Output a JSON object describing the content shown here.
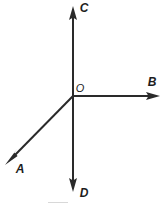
{
  "figure": {
    "type": "ray-diagram",
    "background_color": "#ffffff",
    "stroke_color": "#2a2a2a",
    "label_color": "#1d1d1d",
    "stroke_width": 2,
    "width": 166,
    "height": 207,
    "origin": {
      "label": "O",
      "x": 73,
      "y": 96,
      "label_x": 79,
      "label_y": 88
    },
    "rays": [
      {
        "label": "A",
        "name": "ray-a",
        "direction": "down-left",
        "from_x": 73,
        "from_y": 96,
        "to_x": 9,
        "to_y": 161,
        "angle_deg": 225,
        "label_x": 19,
        "label_y": 169
      },
      {
        "label": "B",
        "name": "ray-b",
        "direction": "right",
        "from_x": 73,
        "from_y": 96,
        "to_x": 158,
        "to_y": 96,
        "angle_deg": 0,
        "label_x": 152,
        "label_y": 83
      },
      {
        "label": "C",
        "name": "ray-c",
        "direction": "up",
        "from_x": 73,
        "from_y": 96,
        "to_x": 73,
        "to_y": 7,
        "angle_deg": 90,
        "label_x": 84,
        "label_y": 8
      },
      {
        "label": "D",
        "name": "ray-d",
        "direction": "down",
        "from_x": 73,
        "from_y": 96,
        "to_x": 73,
        "to_y": 191,
        "angle_deg": 270,
        "label_x": 84,
        "label_y": 194
      }
    ]
  }
}
